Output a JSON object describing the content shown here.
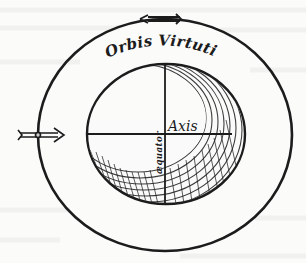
{
  "diagram": {
    "title": "Orbis Virtutis",
    "axis_label": "Axis",
    "equator_label": "æquator",
    "colors": {
      "ink": "#1c1c1c",
      "paper": "#fbfbfa",
      "ghost_text": "#eeeeec"
    },
    "outer_orbit": {
      "cx": 165,
      "cy": 135,
      "rx": 127,
      "ry": 116
    },
    "inner_body": {
      "cx": 166,
      "cy": 134,
      "rx": 79,
      "ry": 70
    },
    "arrows": [
      {
        "name": "top-arrow",
        "direction": "left",
        "x": 155,
        "y": 19
      },
      {
        "name": "left-arrow",
        "direction": "right",
        "x": 38,
        "y": 135
      }
    ]
  }
}
